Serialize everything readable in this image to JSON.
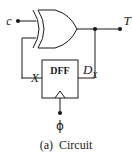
{
  "figure": {
    "caption": "(a)  Circuit",
    "caption_index": "(a)",
    "caption_text": "Circuit",
    "width_px": 132,
    "height_px": 157,
    "background_color": "#ffffff",
    "line_color": "#1a1a1a"
  },
  "circuit": {
    "type": "sequential-logic-toggle-flip-flop",
    "gates": [
      {
        "id": "xor1",
        "name": "xor-gate",
        "kind": "XOR",
        "label": "",
        "inputs": [
          "c",
          "X"
        ],
        "output": "T"
      }
    ],
    "blocks": [
      {
        "id": "dff1",
        "name": "dff-block",
        "label": "DFF",
        "data_input": "D_X",
        "clock_input": "ϕ",
        "output": "X"
      }
    ],
    "terminals": [
      {
        "id": "c",
        "label": "c",
        "side": "input-left",
        "has_dot": true
      },
      {
        "id": "T",
        "label": "T",
        "side": "output-right",
        "has_dot": true
      },
      {
        "id": "phi",
        "label": "ϕ",
        "side": "input-bottom",
        "has_dot": true
      }
    ],
    "signals": [
      {
        "id": "X",
        "base": "X",
        "subscript": "",
        "role": "dff-output-feedback"
      },
      {
        "id": "DX",
        "base": "D",
        "subscript": "X",
        "role": "dff-data-input"
      },
      {
        "id": "T",
        "base": "T",
        "subscript": "",
        "role": "xor-output"
      },
      {
        "id": "c",
        "base": "c",
        "subscript": "",
        "role": "control-input"
      }
    ],
    "junction_nodes": [
      {
        "id": "node-T",
        "label": "",
        "description": "xor-output-tap-to-DX"
      }
    ],
    "labels": {
      "input_c": "c",
      "output_t": "T",
      "dff_title": "DFF",
      "signal_x": "X",
      "signal_d_base": "D",
      "signal_d_sub": "X",
      "clock_phi": "ϕ"
    }
  }
}
